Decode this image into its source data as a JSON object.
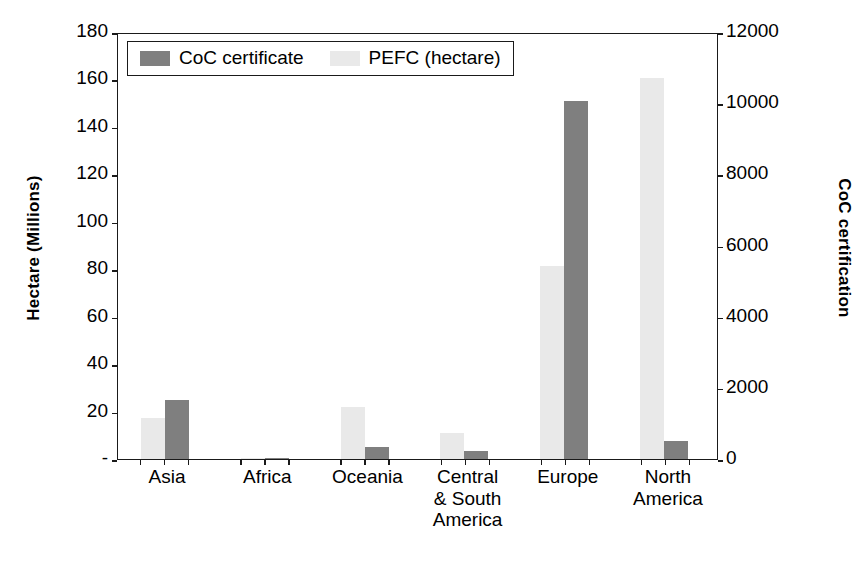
{
  "chart_data": {
    "type": "bar",
    "title": "",
    "subtitle": "",
    "categories": [
      "Asia",
      "Africa",
      "Oceania",
      "Central\n& South\nAmerica",
      "Europe",
      "North\nAmerica"
    ],
    "category_labels": [
      [
        "Asia"
      ],
      [
        "Africa"
      ],
      [
        "Oceania"
      ],
      [
        "Central",
        "& South",
        "America"
      ],
      [
        "Europe"
      ],
      [
        "North",
        "America"
      ]
    ],
    "series": [
      {
        "name": "CoC certificate",
        "axis": "right",
        "color": "#7f7f7f",
        "unit": "certificates",
        "values": [
          1650,
          30,
          350,
          220,
          10050,
          500
        ]
      },
      {
        "name": "PEFC (hectare)",
        "axis": "left",
        "color": "#e9e9e9",
        "unit": "hectares (millions)",
        "values": [
          17.5,
          0.4,
          22.0,
          11.0,
          81.5,
          160.5
        ]
      }
    ],
    "xlabel": "",
    "ylabel_left": "Hectare (Millions)",
    "ylabel_right": "CoC certification",
    "ylim_left": [
      0,
      180
    ],
    "ylim_right": [
      0,
      12000
    ],
    "yticks_left": [
      "-",
      "20",
      "40",
      "60",
      "80",
      "100",
      "120",
      "140",
      "160",
      "180"
    ],
    "yticks_left_values": [
      0,
      20,
      40,
      60,
      80,
      100,
      120,
      140,
      160,
      180
    ],
    "yticks_right": [
      "0",
      "2000",
      "4000",
      "6000",
      "8000",
      "10000",
      "12000"
    ],
    "yticks_right_values": [
      0,
      2000,
      4000,
      6000,
      8000,
      10000,
      12000
    ],
    "grid": false,
    "legend_position": "top-left",
    "legend_entries": [
      {
        "label": "CoC certificate",
        "swatch": "coc"
      },
      {
        "label": "PEFC (hectare)",
        "swatch": "pefc"
      }
    ]
  }
}
